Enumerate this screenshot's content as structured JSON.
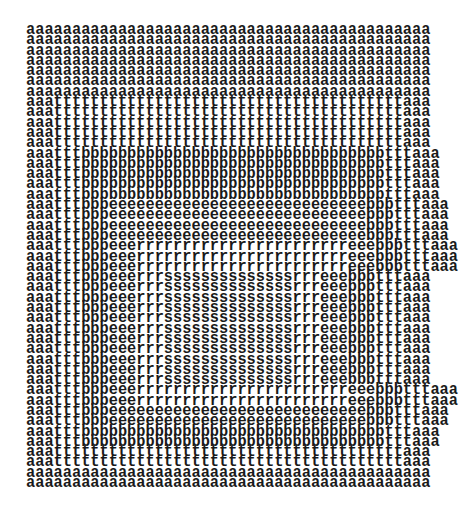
{
  "artwork": {
    "description": "Typewriter concrete-poetry art: nested rectangular frames of letters a, t, b, e, r, s",
    "ink_color": "#1a1a1a",
    "background_color": "#ffffff",
    "columns": 44,
    "rows": [
      "aaaaaaaaaaaaaaaaaaaaaaaaaaaaaaaaaaaaaaaaaaaa",
      "aaaaaaaaaaaaaaaaaaaaaaaaaaaaaaaaaaaaaaaaaaaa",
      "aaaaaaaaaaaaaaaaaaaaaaaaaaaaaaaaaaaaaaaaaaaa",
      "aaaaaaaaaaaaaaaaaaaaaaaaaaaaaaaaaaaaaaaaaaaa",
      "aaaaaaaaaaaaaaaaaaaaaaaaaaaaaaaaaaaaaaaaaaaa",
      "aaaaaaaaaaaaaaaaaaaaaaaaaaaaaaaaaaaaaaaaaaaa",
      "aaaaaaaaaaaaaaaaaaaaaaaaaaaaaaaaaaaaaaaaaaaa",
      "aaattttttttttttttttttttttttttttttttttttttaaa",
      "aaattttttttttttttttttttttttttttttttttttttaaa",
      "aaattttttttttttttttttttttttttttttttttttttaaa",
      "aaattttttttttttttttttttttttttttttttttttttaaa",
      "aaattttttttttttttttttttttttttttttttttttttaaa",
      "aaatttbbbbbbbbbbbbbbbbbbbbbbbbbbbbbbbbbtttaaa",
      "aaatttbbbbbbbbbbbbbbbbbbbbbbbbbbbbbbbbbtttaaa",
      "aaatttbbbbbbbbbbbbbbbbbbbbbbbbbbbbbbbbbtttaaa",
      "aaatttbbbbbbbbbbbbbbbbbbbbbbbbbbbbbbbbbtttaaa",
      "aaatttbbbbbbbbbbbbbbbbbbbbbbbbbbbbbbbbbtttaaa",
      "aaatttbbbeeeeeeeeeeeeeeeeeeeeeeeeeeeebbbtttaaa",
      "aaatttbbbeeeeeeeeeeeeeeeeeeeeeeeeeeeebbbtttaaa",
      "aaatttbbbeeeeeeeeeeeeeeeeeeeeeeeeeeeebbbtttaaa",
      "aaatttbbbeeeeeeeeeeeeeeeeeeeeeeeeeeeebbbtttaaa",
      "aaatttbbbeeerrrrrrrrrrrrrrrrrrrrrrreeebbbtttaaa",
      "aaatttbbbeeerrrrrrrrrrrrrrrrrrrrrrreeebbbtttaaa",
      "aaatttbbbeeerrrrrrrrrrrrrrrrrrrrrrreeebbbtttaaa",
      "aaatttbbbeeerrrssssssssssssssrrreeebbbtttaaa",
      "aaatttbbbeeerrrssssssssssssssrrreeebbbtttaaa",
      "aaatttbbbeeerrrssssssssssssssrrreeebbbtttaaa",
      "aaatttbbbeeerrrssssssssssssssrrreeebbbtttaaa",
      "aaatttbbbeeerrrssssssssssssssrrreeebbbtttaaa",
      "aaatttbbbeeerrrssssssssssssssrrreeebbbtttaaa",
      "aaatttbbbeeerrrssssssssssssssrrreeebbbtttaaa",
      "aaatttbbbeeerrrssssssssssssssrrreeebbbtttaaa",
      "aaatttbbbeeerrrssssssssssssssrrreeebbbtttaaa",
      "aaatttbbbeeerrrssssssssssssssrrreeebbbtttaaa",
      "aaatttbbbeeerrrssssssssssssssrrreeebbbtttaaa",
      "aaatttbbbeeerrrrrrrrrrrrrrrrrrrrrrreeebbbtttaaa",
      "aaatttbbbeeerrrrrrrrrrrrrrrrrrrrrrreeebbbtttaaa",
      "aaatttbbbeeeeeeeeeeeeeeeeeeeeeeeeeeeebbbtttaaa",
      "aaatttbbbeeeeeeeeeeeeeeeeeeeeeeeeeeeebbbtttaaa",
      "aaatttbbbbbbbbbbbbbbbbbbbbbbbbbbbbbbbbbtttaaa",
      "aaatttbbbbbbbbbbbbbbbbbbbbbbbbbbbbbbbbbtttaaa",
      "aaattttttttttttttttttttttttttttttttttttttaaa",
      "aaattttttttttttttttttttttttttttttttttttttaaa",
      "aaaaaaaaaaaaaaaaaaaaaaaaaaaaaaaaaaaaaaaaaaaa",
      "aaaaaaaaaaaaaaaaaaaaaaaaaaaaaaaaaaaaaaaaaaaa"
    ]
  }
}
